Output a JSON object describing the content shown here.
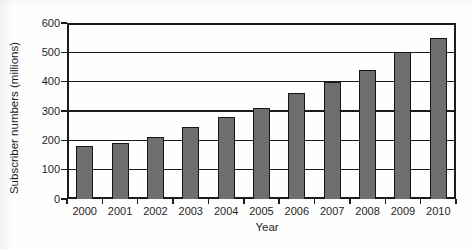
{
  "chart_data": {
    "type": "bar",
    "title": "",
    "xlabel": "Year",
    "ylabel": "Subscriber numbers (millions)",
    "categories": [
      "2000",
      "2001",
      "2002",
      "2003",
      "2004",
      "2005",
      "2006",
      "2007",
      "2008",
      "2009",
      "2010"
    ],
    "values": [
      180,
      190,
      210,
      245,
      280,
      310,
      360,
      400,
      440,
      500,
      550
    ],
    "ylim": [
      0,
      600
    ],
    "yticks": [
      0,
      100,
      200,
      300,
      400,
      500,
      600
    ],
    "grid": "horizontal",
    "legend": "none",
    "series_name": "Subscriber numbers",
    "colors": {
      "bar_fill": "#6e6e6e",
      "bar_border": "#161616",
      "axis": "#1b1b1b",
      "text": "#1f1f1f",
      "background": "#fefefe"
    }
  }
}
